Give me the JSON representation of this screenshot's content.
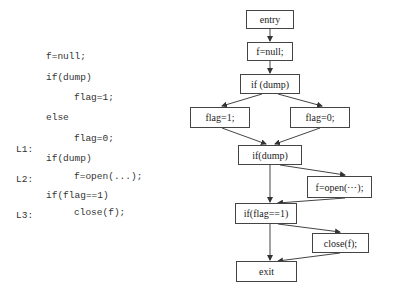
{
  "code": {
    "lines": [
      {
        "label": "",
        "indent": 0,
        "text": "f=null;"
      },
      {
        "label": "",
        "indent": 0,
        "text": "if(dump)"
      },
      {
        "label": "",
        "indent": 1,
        "text": "flag=1;"
      },
      {
        "label": "",
        "indent": 0,
        "text": "else"
      },
      {
        "label": "",
        "indent": 1,
        "text": "flag=0;"
      },
      {
        "label": "L1:",
        "indent": 0,
        "text": "if(dump)"
      },
      {
        "label": "L2:",
        "indent": 1,
        "text": "f=open(...);"
      },
      {
        "label": "",
        "indent": 0,
        "text": "if(flag==1)"
      },
      {
        "label": "L3:",
        "indent": 1,
        "text": "close(f);"
      }
    ]
  },
  "cfg": {
    "nodes": {
      "entry": "entry",
      "f_null": "f=null;",
      "if_dump_1": "if (dump)",
      "flag1": "flag=1;",
      "flag0": "flag=0;",
      "if_dump_2": "if(dump)",
      "f_open": "f=open(⋯);",
      "if_flag": "if(flag==1)",
      "close": "close(f);",
      "exit": "exit"
    },
    "edges": [
      [
        "entry",
        "f_null"
      ],
      [
        "f_null",
        "if_dump_1"
      ],
      [
        "if_dump_1",
        "flag1"
      ],
      [
        "if_dump_1",
        "flag0"
      ],
      [
        "flag1",
        "if_dump_2"
      ],
      [
        "flag0",
        "if_dump_2"
      ],
      [
        "if_dump_2",
        "f_open"
      ],
      [
        "if_dump_2",
        "if_flag"
      ],
      [
        "f_open",
        "if_flag"
      ],
      [
        "if_flag",
        "close"
      ],
      [
        "if_flag",
        "exit"
      ],
      [
        "close",
        "exit"
      ]
    ]
  }
}
